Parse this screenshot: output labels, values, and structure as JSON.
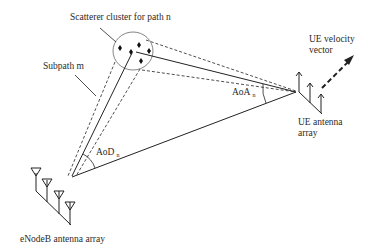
{
  "labels": {
    "scatterer_cluster": "Scatterer cluster for path n",
    "subpath": "Subpath m",
    "ue_velocity_line1": "UE velocity",
    "ue_velocity_line2": "vector",
    "aoa": "AoA",
    "aoa_sub": "n",
    "aod": "AoD",
    "aod_sub": "n",
    "ue_array_line1": "UE antenna",
    "ue_array_line2": "array",
    "enodeb_array": "eNodeB antenna array"
  },
  "colors": {
    "line": "#222222",
    "circle": "#555555",
    "background": "#ffffff"
  }
}
